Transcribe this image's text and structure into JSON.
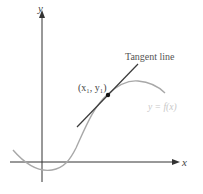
{
  "diagram": {
    "axes": {
      "x_label": "x",
      "y_label": "y"
    },
    "curve_label": "y = f(x)",
    "tangent_label": "Tangent line",
    "point_label": "(x₁, y₁)",
    "colors": {
      "axis": "#333333",
      "curve": "#a8a8a8",
      "tangent": "#3a3a3a",
      "point": "#111111",
      "curve_label": "#c8c8c8",
      "text": "#555555"
    }
  }
}
